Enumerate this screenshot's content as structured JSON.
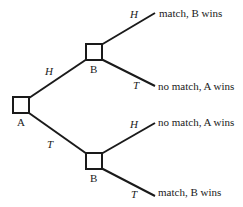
{
  "tree": {
    "root": {
      "label": "A"
    },
    "nodes": [
      {
        "id": "upper",
        "label": "B"
      },
      {
        "id": "lower",
        "label": "B"
      }
    ],
    "edges": {
      "a_upper": "H",
      "a_lower": "T",
      "upper_h": "H",
      "upper_t": "T",
      "lower_h": "H",
      "lower_t": "T"
    },
    "outcomes": [
      "match, B wins",
      "no match, A wins",
      "no match, A wins",
      "match, B wins"
    ]
  }
}
